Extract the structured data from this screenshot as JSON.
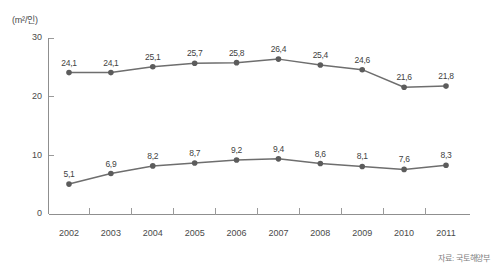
{
  "chart_data": {
    "type": "line",
    "title": "",
    "subtitle": "",
    "xlabel": "",
    "ylabel": "",
    "unit_label": "(m²/인)",
    "source": "자료: 국토해양부",
    "categories": [
      "2002",
      "2003",
      "2004",
      "2005",
      "2006",
      "2007",
      "2008",
      "2009",
      "2010",
      "2011"
    ],
    "ylim": [
      0,
      30
    ],
    "yticks": [
      0,
      10,
      20,
      30
    ],
    "ytick_labels": [
      "0",
      "10",
      "20",
      "30"
    ],
    "grid": false,
    "legend": "none",
    "decimal_separator": ",",
    "series": [
      {
        "name": "upper-series",
        "color": "#6e6e6e",
        "values": [
          24.1,
          24.1,
          25.1,
          25.7,
          25.8,
          26.4,
          25.4,
          24.6,
          21.6,
          21.8
        ],
        "labels": [
          "24,1",
          "24,1",
          "25,1",
          "25,7",
          "25,8",
          "26,4",
          "25,4",
          "24,6",
          "21,6",
          "21,8"
        ]
      },
      {
        "name": "lower-series",
        "color": "#6e6e6e",
        "values": [
          5.1,
          6.9,
          8.2,
          8.7,
          9.2,
          9.4,
          8.6,
          8.1,
          7.6,
          8.3
        ],
        "labels": [
          "5,1",
          "6,9",
          "8,2",
          "8,7",
          "9,2",
          "9,4",
          "8,6",
          "8,1",
          "7,6",
          "8,3"
        ]
      }
    ]
  }
}
